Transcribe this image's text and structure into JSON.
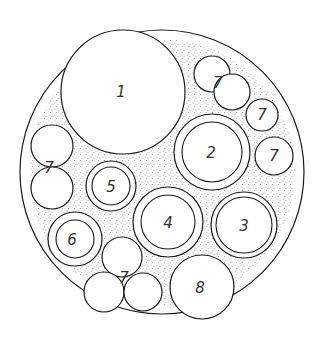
{
  "diagram": {
    "type": "cable cross-section",
    "colors": {
      "line": "#1a1a1a",
      "fill": "#ffffff",
      "stipple": "#555555",
      "label": "#333333"
    },
    "outer": {
      "cx": 162,
      "cy": 172,
      "r_outer": 142,
      "r_inner": 133
    },
    "components": [
      {
        "id": "c1",
        "label": "1",
        "cx": 123,
        "cy": 92,
        "r": 62,
        "ring": false
      },
      {
        "id": "c2",
        "label": "2",
        "cx": 212,
        "cy": 152,
        "r": 38,
        "r_inner": 30,
        "ring": true
      },
      {
        "id": "c3",
        "label": "3",
        "cx": 244,
        "cy": 225,
        "r": 33,
        "r_inner": 28,
        "ring": true
      },
      {
        "id": "c4",
        "label": "4",
        "cx": 168,
        "cy": 222,
        "r": 35,
        "r_inner": 27,
        "ring": true
      },
      {
        "id": "c5",
        "label": "5",
        "cx": 111,
        "cy": 186,
        "r": 25,
        "r_inner": 19,
        "ring": true
      },
      {
        "id": "c6",
        "label": "6",
        "cx": 75,
        "cy": 239,
        "r": 27,
        "r_inner": 19,
        "ring": true
      },
      {
        "id": "c8",
        "label": "8",
        "cx": 202,
        "cy": 287,
        "r": 32,
        "ring": false
      }
    ],
    "groups7": [
      {
        "label": "7",
        "lx": 218,
        "ly": 83,
        "circles": [
          {
            "cx": 212,
            "cy": 74,
            "r": 18
          },
          {
            "cx": 232,
            "cy": 92,
            "r": 18
          }
        ]
      },
      {
        "label": "7",
        "lx": 262,
        "ly": 115,
        "circles": [
          {
            "cx": 262,
            "cy": 115,
            "r": 16
          }
        ]
      },
      {
        "label": "7",
        "lx": 274,
        "ly": 156,
        "circles": [
          {
            "cx": 274,
            "cy": 156,
            "r": 19
          }
        ]
      },
      {
        "label": "7",
        "lx": 49,
        "ly": 168,
        "circles": [
          {
            "cx": 52,
            "cy": 146,
            "r": 21
          },
          {
            "cx": 52,
            "cy": 188,
            "r": 21
          }
        ]
      },
      {
        "label": "7",
        "lx": 124,
        "ly": 278,
        "circles": [
          {
            "cx": 122,
            "cy": 257,
            "r": 20
          },
          {
            "cx": 104,
            "cy": 292,
            "r": 20
          },
          {
            "cx": 143,
            "cy": 292,
            "r": 19
          }
        ]
      }
    ],
    "labels": {
      "c1": "1",
      "c2": "2",
      "c3": "3",
      "c4": "4",
      "c5": "5",
      "c6": "6",
      "c8": "8",
      "g7a": "7",
      "g7b": "7",
      "g7c": "7",
      "g7d": "7",
      "g7e": "7"
    }
  }
}
